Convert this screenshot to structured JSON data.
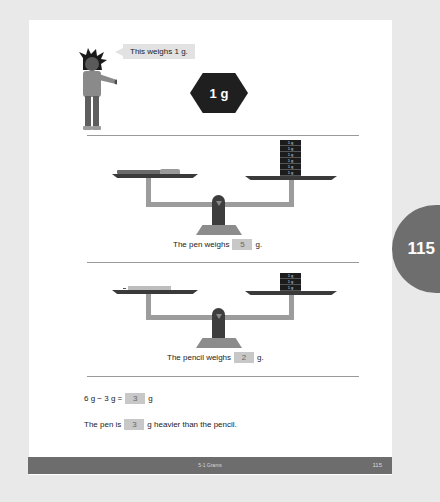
{
  "page": {
    "side_tab_number": "115",
    "intro": {
      "speech_bubble": "This weighs 1 g.",
      "weight_label": "1 g"
    },
    "scale_pen": {
      "left_item": "pen",
      "right_weights": [
        "1 g",
        "1 g",
        "1 g",
        "1 g",
        "1 g",
        "1 g"
      ],
      "sentence_prefix": "The pen weighs",
      "answer": "5",
      "unit": "g."
    },
    "scale_pencil": {
      "left_item": "pencil",
      "right_weights": [
        "1 g",
        "1 g",
        "1 g"
      ],
      "sentence_prefix": "The pencil weighs",
      "answer": "2",
      "unit": "g."
    },
    "equation": {
      "expression": "6 g − 3 g =",
      "answer": "3",
      "unit": "g"
    },
    "comparison": {
      "prefix": "The pen is",
      "answer": "3",
      "suffix": "g heavier than the pencil."
    },
    "footer": {
      "section_title": "5-1 Grams",
      "page_number": "115"
    }
  },
  "colors": {
    "background": "#e9e9e9",
    "page": "#ffffff",
    "accent_dark": "#1f1f1f",
    "footer": "#6d6d6d",
    "answer_box": "#c8c8c8"
  }
}
